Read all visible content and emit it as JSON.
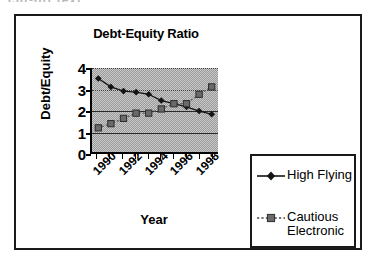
{
  "artifact": {
    "top_text": "cut-off text"
  },
  "chart_data": {
    "type": "line",
    "title": "Debt-Equity Ratio",
    "xlabel": "Year",
    "ylabel": "Debt/Equity",
    "x": [
      1990,
      1991,
      1992,
      1993,
      1994,
      1995,
      1996,
      1997,
      1998,
      1999
    ],
    "xtick_labels": [
      "1990",
      "1992",
      "1994",
      "1996",
      "1998"
    ],
    "xtick_values": [
      1990,
      1992,
      1994,
      1996,
      1998
    ],
    "ytick_labels": [
      "0",
      "1",
      "2",
      "3",
      "4"
    ],
    "ytick_values": [
      0,
      1,
      2,
      3,
      4
    ],
    "ylim": [
      0,
      4
    ],
    "xlim": [
      1989.5,
      1999.5
    ],
    "grid": true,
    "legend_position": "right-bottom",
    "plot_background": "#b5b5b5",
    "series": [
      {
        "name": "High Flying",
        "marker": "diamond",
        "color": "#141414",
        "line_style": "solid",
        "values": [
          3.5,
          3.1,
          2.9,
          2.85,
          2.75,
          2.45,
          2.3,
          2.15,
          1.95,
          1.8
        ]
      },
      {
        "name": "Cautious Electronic",
        "marker": "square",
        "color": "#5c5c5c",
        "line_style": "dotted",
        "values": [
          1.15,
          1.35,
          1.6,
          1.85,
          1.85,
          2.05,
          2.3,
          2.3,
          2.75,
          3.1
        ]
      }
    ]
  },
  "legend": {
    "items": [
      {
        "label": "High Flying",
        "label_line2": ""
      },
      {
        "label": "Cautious",
        "label_line2": "Electronic"
      }
    ]
  }
}
